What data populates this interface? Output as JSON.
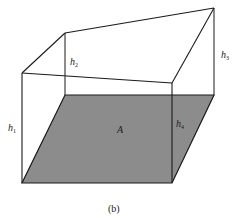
{
  "figure": {
    "caption": "(b)",
    "base_label": "A",
    "heights": [
      {
        "name": "h",
        "sub": "1"
      },
      {
        "name": "h",
        "sub": "2"
      },
      {
        "name": "h",
        "sub": "3"
      },
      {
        "name": "h",
        "sub": "4"
      }
    ],
    "colors": {
      "base_fill": "#8c8c8c",
      "edge": "#1a1a1a",
      "background": "#ffffff"
    }
  }
}
